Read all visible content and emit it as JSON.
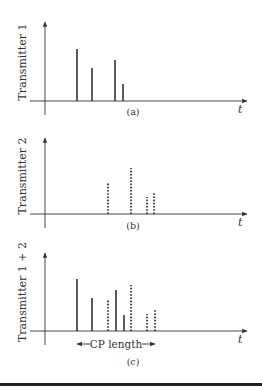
{
  "figure": {
    "panels": [
      {
        "id": "a",
        "caption": "(a)",
        "ylabel": "Transmitter 1",
        "xlabel": "t",
        "baseline_y": 101,
        "axis_top_y": 22,
        "caption_y": 115,
        "label_center_y": 62,
        "impulses": [
          {
            "x": 77,
            "top": 49,
            "style": "solid"
          },
          {
            "x": 92,
            "top": 68,
            "style": "solid"
          },
          {
            "x": 115,
            "top": 60,
            "style": "solid"
          },
          {
            "x": 123,
            "top": 84,
            "style": "solid"
          }
        ]
      },
      {
        "id": "b",
        "caption": "(b)",
        "ylabel": "Transmitter 2",
        "xlabel": "t",
        "baseline_y": 214,
        "axis_top_y": 138,
        "caption_y": 229,
        "label_center_y": 176,
        "impulses": [
          {
            "x": 108,
            "top": 183,
            "style": "dashed"
          },
          {
            "x": 131,
            "top": 168,
            "style": "dashed"
          },
          {
            "x": 147,
            "top": 197,
            "style": "dashed"
          },
          {
            "x": 154,
            "top": 192,
            "style": "dashed"
          }
        ]
      },
      {
        "id": "c",
        "caption": "(c)",
        "ylabel": "Transmitter 1 + 2",
        "xlabel": "t",
        "baseline_y": 331,
        "axis_top_y": 253,
        "caption_y": 365,
        "label_center_y": 292,
        "impulses": [
          {
            "x": 77,
            "top": 279,
            "style": "solid"
          },
          {
            "x": 92,
            "top": 298,
            "style": "solid"
          },
          {
            "x": 108,
            "top": 300,
            "style": "dashed"
          },
          {
            "x": 116,
            "top": 290,
            "style": "solid"
          },
          {
            "x": 124,
            "top": 315,
            "style": "solid"
          },
          {
            "x": 131,
            "top": 285,
            "style": "dashed"
          },
          {
            "x": 147,
            "top": 314,
            "style": "dashed"
          },
          {
            "x": 155,
            "top": 309,
            "style": "dashed"
          }
        ],
        "annotation": {
          "label": "CP length",
          "x_start": 77,
          "x_end": 155,
          "y": 344
        }
      }
    ],
    "colors": {
      "ink": "#333333",
      "rule": "#222222",
      "background": "#ffffff"
    }
  }
}
